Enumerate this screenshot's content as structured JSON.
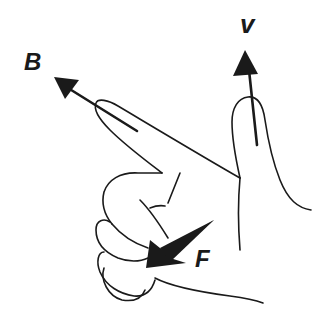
{
  "diagram": {
    "labels": {
      "B": "B",
      "V": "v",
      "F": "F"
    },
    "vectors": [
      {
        "label": "B",
        "meaning": "magnetic field",
        "pointed_by": "index finger",
        "direction": "up-left"
      },
      {
        "label": "v",
        "meaning": "velocity",
        "pointed_by": "middle finger",
        "direction": "up"
      },
      {
        "label": "F",
        "meaning": "force",
        "pointed_by": "thumb",
        "direction": "down-left"
      }
    ],
    "colors": {
      "ink": "#1a1a1a",
      "background": "#ffffff"
    }
  }
}
